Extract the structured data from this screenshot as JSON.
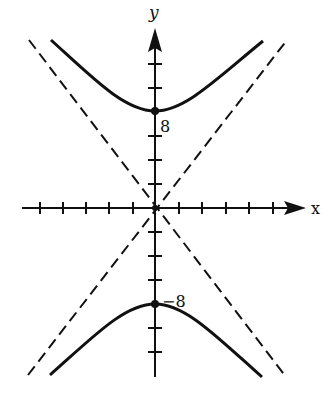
{
  "diagram": {
    "type": "hyperbola",
    "equation": "y^2/64 - x^2/40 = 1",
    "axes": {
      "x_label": "x",
      "y_label": "y",
      "tick_spacing_units": 2,
      "x_ticks_each_side": 5,
      "y_ticks_up": 4,
      "y_ticks_down": 7
    },
    "vertices": [
      {
        "label": "8",
        "y": 8
      },
      {
        "label": "−8",
        "y": -8
      }
    ],
    "asymptotes": "dashed",
    "colors": {
      "ink": "#111111",
      "background": "#ffffff"
    }
  }
}
